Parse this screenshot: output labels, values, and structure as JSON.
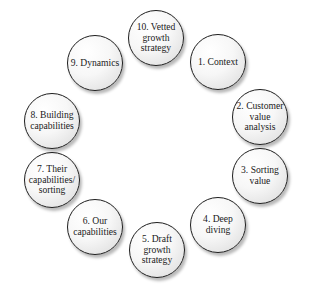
{
  "diagram": {
    "type": "cycle",
    "nodes": [
      {
        "id": 10,
        "label": "10. Vetted\ngrowth\nstrategy",
        "cx": 156,
        "cy": 38
      },
      {
        "id": 1,
        "label": "1. Context",
        "cx": 218,
        "cy": 62
      },
      {
        "id": 2,
        "label": "2. Customer\nvalue\nanalysis",
        "cx": 260,
        "cy": 117
      },
      {
        "id": 3,
        "label": "3. Sorting\nvalue",
        "cx": 260,
        "cy": 176
      },
      {
        "id": 4,
        "label": "4. Deep\ndiving",
        "cx": 218,
        "cy": 225
      },
      {
        "id": 5,
        "label": "5. Draft\ngrowth\nstrategy",
        "cx": 157,
        "cy": 250
      },
      {
        "id": 6,
        "label": "6. Our\ncapabilities",
        "cx": 95,
        "cy": 227
      },
      {
        "id": 7,
        "label": "7. Their\ncapabilities/\nsorting",
        "cx": 52,
        "cy": 180
      },
      {
        "id": 8,
        "label": "8. Building\ncapabilities",
        "cx": 52,
        "cy": 121
      },
      {
        "id": 9,
        "label": "9. Dynamics",
        "cx": 95,
        "cy": 63
      }
    ]
  }
}
